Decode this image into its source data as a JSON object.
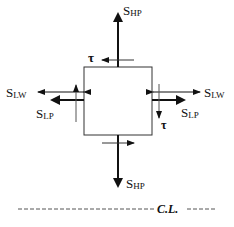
{
  "labels": {
    "s_hp_top": {
      "main": "S",
      "sub": "HP"
    },
    "s_hp_bottom": {
      "main": "S",
      "sub": "HP"
    },
    "s_lw_left": {
      "main": "S",
      "sub": "LW"
    },
    "s_lw_right": {
      "main": "S",
      "sub": "LW"
    },
    "s_lp_left": {
      "main": "S",
      "sub": "LP"
    },
    "s_lp_right": {
      "main": "S",
      "sub": "LP"
    },
    "tau_top": "τ",
    "tau_right": "τ",
    "centerline": "C.L."
  },
  "colors": {
    "stroke": "#111111",
    "thin_stroke": "#444444",
    "background": "#ffffff"
  }
}
